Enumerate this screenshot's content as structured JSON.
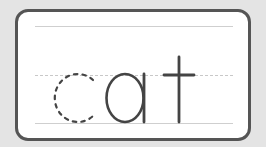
{
  "word": "cat",
  "letters": [
    {
      "char": "c",
      "style": "dotted-trace"
    },
    {
      "char": "a",
      "style": "solid"
    },
    {
      "char": "t",
      "style": "solid"
    }
  ],
  "colors": {
    "background": "#e4e4e4",
    "card_border": "#555555",
    "letter": "#444444",
    "guide_lines": "#cfcfcf"
  }
}
